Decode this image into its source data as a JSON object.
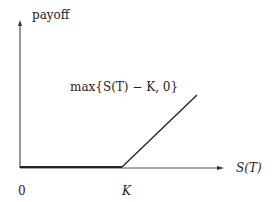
{
  "diagram": {
    "y_axis_label": "payoff",
    "x_axis_label": "S(T)",
    "formula_label": "max{S(T) − K, 0}",
    "origin_label": "0",
    "strike_label": "K",
    "line_color": "#222222"
  }
}
